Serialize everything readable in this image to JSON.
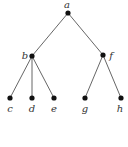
{
  "diagram": {
    "type": "tree",
    "colors": {
      "node": "#111111",
      "edge": "#555555",
      "label": "#333333",
      "background": "#ffffff"
    },
    "nodes": [
      {
        "id": "a",
        "label": "a",
        "x": 68,
        "y": 13,
        "lx": 67,
        "ly": 8
      },
      {
        "id": "b",
        "label": "b",
        "x": 32,
        "y": 56,
        "lx": 25,
        "ly": 59
      },
      {
        "id": "f",
        "label": "f",
        "x": 103,
        "y": 55,
        "lx": 111,
        "ly": 59
      },
      {
        "id": "c",
        "label": "c",
        "x": 10,
        "y": 98,
        "lx": 10,
        "ly": 112
      },
      {
        "id": "d",
        "label": "d",
        "x": 32,
        "y": 98,
        "lx": 32,
        "ly": 112
      },
      {
        "id": "e",
        "label": "e",
        "x": 54,
        "y": 98,
        "lx": 54,
        "ly": 112
      },
      {
        "id": "g",
        "label": "g",
        "x": 85,
        "y": 98,
        "lx": 85,
        "ly": 112
      },
      {
        "id": "h",
        "label": "h",
        "x": 121,
        "y": 98,
        "lx": 120,
        "ly": 112
      }
    ],
    "edges": [
      [
        "a",
        "b"
      ],
      [
        "a",
        "f"
      ],
      [
        "b",
        "c"
      ],
      [
        "b",
        "d"
      ],
      [
        "b",
        "e"
      ],
      [
        "f",
        "g"
      ],
      [
        "f",
        "h"
      ]
    ]
  }
}
